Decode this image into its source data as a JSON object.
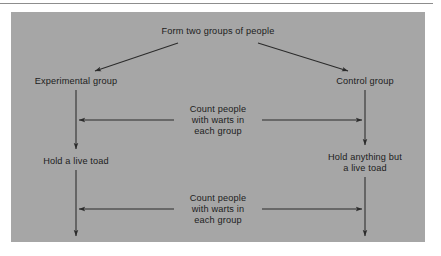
{
  "figure": {
    "background_color": "#ffffff",
    "panel_color": "#a6a6a6",
    "line_color": "#2b2b2b",
    "text_color": "#1c1c1c",
    "rule_color": "#8d8d8d"
  },
  "diagram": {
    "type": "flowchart",
    "title_node": "Form two groups of people",
    "nodes": {
      "root": "Form two groups of people",
      "left_group": "Experimental group",
      "right_group": "Control group",
      "left_treatment": "Hold a live toad",
      "right_treatment_line1": "Hold anything but",
      "right_treatment_line2": "a live toad"
    },
    "annotations": {
      "first": {
        "line1": "Count people",
        "line2": "with warts in",
        "line3": "each group"
      },
      "second": {
        "line1": "Count people",
        "line2": "with warts in",
        "line3": "each group"
      }
    },
    "edges": [
      {
        "name": "root-to-experimental",
        "from": "root",
        "to": "left_group",
        "style": "diagonal-arrow"
      },
      {
        "name": "root-to-control",
        "from": "root",
        "to": "right_group",
        "style": "diagonal-arrow"
      },
      {
        "name": "experimental-to-hold-toad",
        "from": "left_group",
        "to": "left_treatment",
        "style": "vertical-arrow"
      },
      {
        "name": "control-to-hold-anything",
        "from": "right_group",
        "to": "right_treatment",
        "style": "vertical-arrow"
      },
      {
        "name": "first-count-connector",
        "from": "left_branch",
        "to": "right_branch",
        "style": "double-headed-horizontal"
      },
      {
        "name": "hold-toad-down",
        "from": "left_treatment",
        "to": "end_left",
        "style": "vertical-arrow"
      },
      {
        "name": "hold-anything-down",
        "from": "right_treatment",
        "to": "end_right",
        "style": "vertical-arrow"
      },
      {
        "name": "second-count-connector",
        "from": "left_branch",
        "to": "right_branch",
        "style": "double-headed-horizontal"
      }
    ]
  }
}
